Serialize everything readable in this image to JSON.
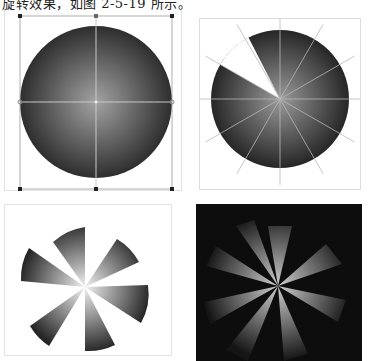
{
  "caption": {
    "text": "旋转效果，如图 2-5-19 所示。"
  },
  "figures": [
    {
      "id": "step-1",
      "description": "Circle with radial gradient fill, selected with bounding box and 8 handles, center crosshair guides",
      "gradient": {
        "center": "#9a9a9a",
        "edge": "#2e2e2e"
      },
      "handles": 8
    },
    {
      "id": "step-2",
      "description": "Circle divided into 12 wedges by guide lines through center; one wedge cut out (white) at upper-left",
      "wedge_count": 12,
      "removed_wedge": "upper-left"
    },
    {
      "id": "step-3",
      "description": "Six gradient wedges radiating from center on white background (pinwheel)",
      "wedge_count": 6,
      "background": "#ffffff",
      "wedge_gradient": {
        "center": "#f0f0f0",
        "edge": "#2a2a2a"
      }
    },
    {
      "id": "step-4",
      "description": "Light rays: eight gradient wedges glowing on black background",
      "ray_count": 8,
      "background": "#0d0d0d",
      "ray_gradient": {
        "center": "#c8c8c8",
        "edge": "#1a1a1a"
      }
    }
  ]
}
